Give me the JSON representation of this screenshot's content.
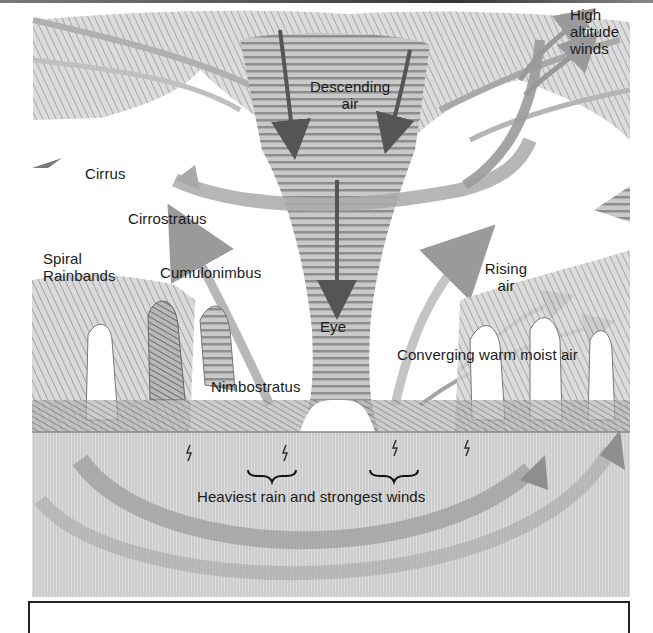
{
  "figure": {
    "colors": {
      "pencil_dark": "#5a5a5a",
      "pencil_mid": "#8a8a8a",
      "pencil_light": "#bdbdbd",
      "paper": "#ffffff",
      "text": "#1a1a1a"
    },
    "labels": {
      "high_altitude_winds": [
        "High",
        "altitude",
        "winds"
      ],
      "descending_air": [
        "Descending",
        "air"
      ],
      "cirrus": "Cirrus",
      "cirrostratus": "Cirrostratus",
      "spiral_rainbands": [
        "Spiral",
        "Rainbands"
      ],
      "cumulonimbus": "Cumulonimbus",
      "rising_air": [
        "Rising",
        "air"
      ],
      "eye": "Eye",
      "converging_air": "Converging warm moist air",
      "nimbostratus": "Nimbostratus",
      "heaviest_rain": "Heaviest rain and strongest winds"
    }
  }
}
